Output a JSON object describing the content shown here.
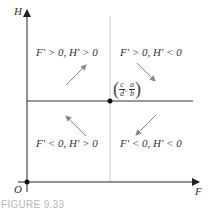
{
  "figure": {
    "caption": "FIGURE 9.33",
    "axes": {
      "x_label": "F",
      "y_label": "H",
      "origin_label": "O"
    },
    "equilibrium": {
      "x_num": "c",
      "x_den": "d",
      "y_num": "a",
      "y_den": "b",
      "separator": ","
    },
    "quadrants": {
      "top_left": "F' > 0, H' > 0",
      "top_right": "F' > 0, H' < 0",
      "bottom_left": "F' < 0, H' > 0",
      "bottom_right": "F' < 0, H' < 0"
    },
    "arrows": {
      "top_left": "up-right",
      "top_right": "down-right",
      "bottom_left": "up-left",
      "bottom_right": "down-left"
    },
    "colors": {
      "axis": "#222222",
      "nullcline_vertical": "#cccccc",
      "nullcline_horizontal": "#333333",
      "arrow": "#888888",
      "caption": "#b8b8b8"
    }
  }
}
